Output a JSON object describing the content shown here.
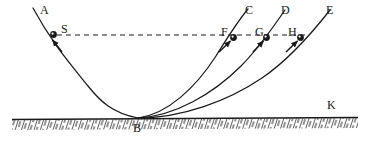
{
  "figure": {
    "type": "physics-diagram",
    "background_color": "#ffffff",
    "ink_color": "#1a1a1a"
  },
  "labels": [
    {
      "id": "A",
      "text": "A",
      "x": 40,
      "y": 4,
      "role": "track-label-left"
    },
    {
      "id": "S",
      "text": "S",
      "x": 61,
      "y": 23,
      "role": "start-point-label"
    },
    {
      "id": "C",
      "text": "C",
      "x": 245,
      "y": 4,
      "role": "track-label-c"
    },
    {
      "id": "D",
      "text": "D",
      "x": 281,
      "y": 4,
      "role": "track-label-d"
    },
    {
      "id": "E",
      "text": "E",
      "x": 326,
      "y": 4,
      "role": "track-label-e"
    },
    {
      "id": "F",
      "text": "F",
      "x": 221,
      "y": 26,
      "role": "point-label-f"
    },
    {
      "id": "G",
      "text": "G",
      "x": 255,
      "y": 26,
      "role": "point-label-g"
    },
    {
      "id": "H",
      "text": "H",
      "x": 288,
      "y": 26,
      "role": "point-label-h"
    },
    {
      "id": "B",
      "text": "B",
      "x": 133,
      "y": 122,
      "role": "valley-bottom-label"
    },
    {
      "id": "K",
      "text": "K",
      "x": 327,
      "y": 99,
      "role": "ground-label"
    }
  ],
  "balls": [
    {
      "id": "S",
      "cx": 53.5,
      "cy": 34.5,
      "r": 3.4
    },
    {
      "id": "F",
      "cx": 233.5,
      "cy": 37.5,
      "r": 3.4
    },
    {
      "id": "G",
      "cx": 266.5,
      "cy": 37.5,
      "r": 3.4
    },
    {
      "id": "H",
      "cx": 300.5,
      "cy": 37.5,
      "r": 3.4
    }
  ],
  "dashed_line": {
    "name": "equal-height-reference-line",
    "x1": 57,
    "y1": 35,
    "x2": 306,
    "y2": 35,
    "dash": "5,4"
  },
  "tracks": [
    {
      "id": "A",
      "name": "descending-track-A",
      "path": "M 33 8 C 52 43 68 61 88 86 C 100 101 112 113 138 118"
    },
    {
      "id": "C",
      "name": "ascending-track-C",
      "path": "M 138 118 C 168 114 196 87 216 56 C 226 40 237 22 248 9"
    },
    {
      "id": "D",
      "name": "ascending-track-D",
      "path": "M 138 118 C 175 116 213 94 241 66 C 258 49 272 29 285 10"
    },
    {
      "id": "E",
      "name": "ascending-track-E",
      "path": "M 138 118 C 182 118 228 101 262 78 C 290 59 312 33 330 10"
    }
  ],
  "velocity_arrows": [
    {
      "id": "S",
      "name": "velocity-arrow-s",
      "x1": 62,
      "y1": 52,
      "x2": 52,
      "y2": 39
    },
    {
      "id": "F",
      "name": "velocity-arrow-f",
      "x1": 219,
      "y1": 52,
      "x2": 231,
      "y2": 40
    },
    {
      "id": "G",
      "name": "velocity-arrow-g",
      "x1": 253,
      "y1": 52,
      "x2": 264,
      "y2": 40
    },
    {
      "id": "H",
      "name": "velocity-arrow-h",
      "x1": 286,
      "y1": 52,
      "x2": 298,
      "y2": 40
    }
  ],
  "ground": {
    "name": "ground-line",
    "y_left": 119,
    "y_right": 117,
    "x_start": 12,
    "x_end": 358,
    "hatch_color": "#2b2b2b"
  }
}
